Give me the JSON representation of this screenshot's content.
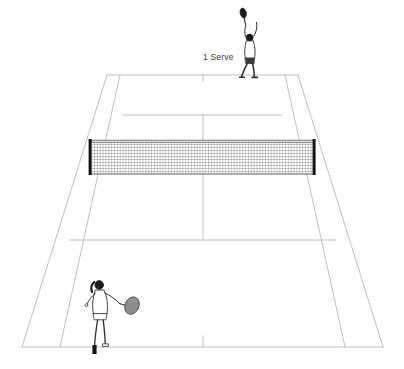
{
  "scene": {
    "title": "Tennis court serve diagram",
    "background_color": "#ffffff",
    "line_color": "#b9b9b9",
    "net_color": "#3a3a3a",
    "post_color": "#111111",
    "figure_ink": "#2b2b2b",
    "racket_face_color": "#8d8d8d"
  },
  "annotations": [
    {
      "id": "serve-label",
      "text": "1 Serve",
      "x": 203,
      "y": 52,
      "color": "#3b3b3b",
      "font_size": 8.5
    }
  ],
  "players": [
    {
      "id": "server",
      "role": "server",
      "position_label": "far-baseline-deuce-side",
      "side": "far",
      "pose": "serve-toss-overhead",
      "has_racket": true,
      "x": 248,
      "y": 46
    },
    {
      "id": "receiver",
      "role": "receiver",
      "position_label": "near-baseline-left",
      "side": "near",
      "pose": "ready-forehand",
      "has_racket": true,
      "x": 108,
      "y": 314
    }
  ],
  "court": {
    "type": "tennis",
    "view": "perspective-from-behind-baseline",
    "surface": "white",
    "elements": [
      "doubles-sideline-left",
      "doubles-sideline-right",
      "singles-sideline-left",
      "singles-sideline-right",
      "far-baseline",
      "near-baseline",
      "far-service-line",
      "near-service-line",
      "center-service-line",
      "center-mark-near",
      "center-mark-far",
      "net"
    ],
    "geometry": {
      "far_baseline_y": 75,
      "near_baseline_y": 347,
      "net_y_top": 141,
      "net_y_bottom": 174,
      "far_service_line_y": 115,
      "near_service_line_y": 240,
      "doubles_far_left_x": 107,
      "doubles_far_right_x": 298,
      "doubles_near_left_x": 22,
      "doubles_near_right_x": 383,
      "singles_far_left_x": 120,
      "singles_far_right_x": 285,
      "singles_near_left_x": 60,
      "singles_near_right_x": 345,
      "net_post_left_x": 91,
      "net_post_right_x": 314,
      "center_x_far": 203,
      "center_x_near": 203
    },
    "net": {
      "mesh_columns": 74,
      "mesh_rows": 11,
      "has_left_post": true,
      "has_right_post": true,
      "has_top_band": true
    }
  }
}
